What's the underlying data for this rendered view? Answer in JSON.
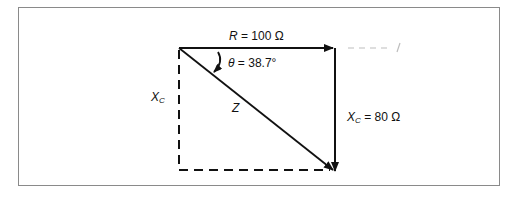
{
  "diagram": {
    "type": "impedance-triangle",
    "labels": {
      "R": {
        "symbol": "R",
        "eq": "= 100 Ω"
      },
      "theta": {
        "symbol": "θ",
        "eq": "= 38.7°"
      },
      "XC_right": {
        "symbol": "X",
        "sub": "C",
        "eq": "= 80 Ω"
      },
      "XC_left": {
        "symbol": "X",
        "sub": "C"
      },
      "Z": {
        "symbol": "Z"
      },
      "dashed_note": "– – – – /"
    },
    "colors": {
      "line": "#111111",
      "frame": "#8a8a8a"
    }
  }
}
